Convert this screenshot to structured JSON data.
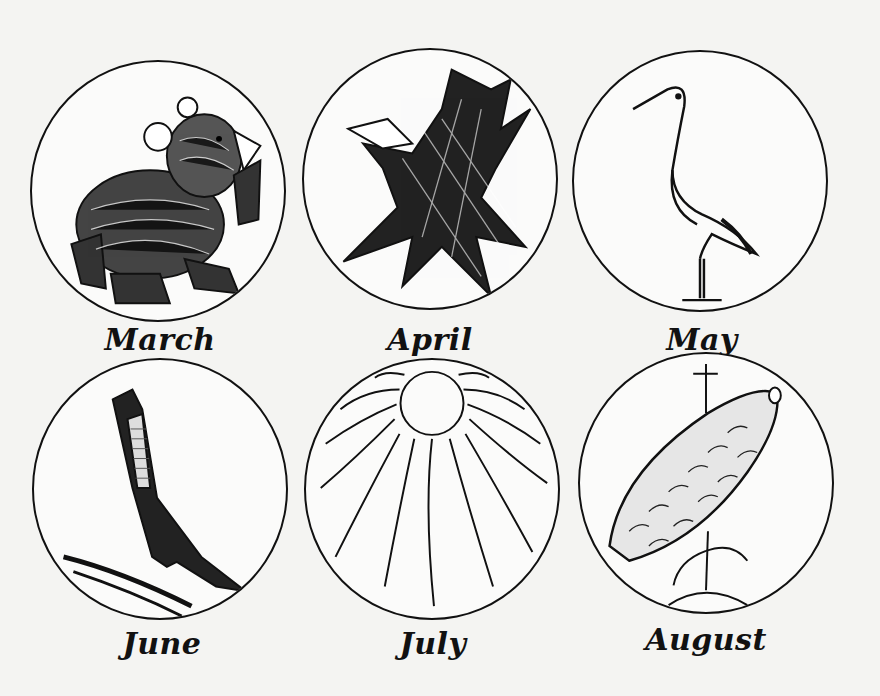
{
  "months": [
    {
      "label": "March",
      "icon": "bear-icon"
    },
    {
      "label": "April",
      "icon": "crow-icon"
    },
    {
      "label": "May",
      "icon": "stork-icon"
    },
    {
      "label": "June",
      "icon": "swallow-icon"
    },
    {
      "label": "July",
      "icon": "sun-icon"
    },
    {
      "label": "August",
      "icon": "corn-icon"
    }
  ]
}
